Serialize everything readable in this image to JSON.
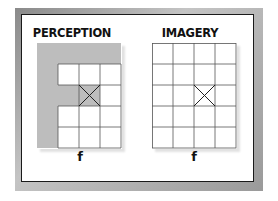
{
  "panels": [
    {
      "title": "PERCEPTION",
      "label": "f",
      "grid": {
        "columns": 4,
        "rows": 5,
        "shaded_color": "#bdbdbd",
        "filled_cells": "letter f pattern; gray shading outside white cells",
        "marked_cell": {
          "row": 2,
          "col": 2,
          "mark": "X"
        }
      }
    },
    {
      "title": "IMAGERY",
      "label": "f",
      "grid": {
        "columns": 4,
        "rows": 5,
        "shaded_color": null,
        "marked_cell": {
          "row": 2,
          "col": 2,
          "mark": "X"
        }
      }
    }
  ],
  "colors": {
    "frame": "#9a9a9a",
    "shade": "#bdbdbd",
    "line": "#555555"
  }
}
